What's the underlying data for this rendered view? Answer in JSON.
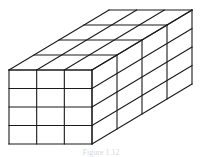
{
  "figure": {
    "dimensions": {
      "width_cubes": 3,
      "height_cubes": 4,
      "depth_cubes": 4
    },
    "total_cubes": 48,
    "stroke_color": "#1a1a1a",
    "background_color": "#ffffff",
    "geometry": {
      "front_left": 9,
      "front_top": 70,
      "front_right": 92,
      "front_bottom": 144,
      "depth_dx": 25,
      "depth_dy": -15
    }
  },
  "caption": {
    "text": "Figure 1.12"
  }
}
